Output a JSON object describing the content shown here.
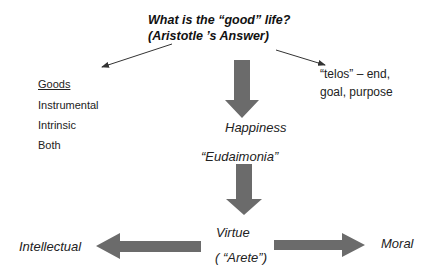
{
  "title": {
    "line1": "What is the “good” life?",
    "line2": "(Aristotle ’s Answer)"
  },
  "goods": {
    "heading": "Goods",
    "items": [
      "Instrumental",
      "Intrinsic",
      "Both"
    ]
  },
  "telos": {
    "line1": "“telos” – end,",
    "line2": "goal, purpose"
  },
  "happiness": {
    "label": "Happiness",
    "greek": "“Eudaimonia”"
  },
  "virtue": {
    "label": "Virtue",
    "greek": "( “Arete”)"
  },
  "branches": {
    "left": "Intellectual",
    "right": "Moral"
  },
  "colors": {
    "arrow_fill": "#6b6b6b",
    "line": "#333333",
    "text": "#222222"
  }
}
